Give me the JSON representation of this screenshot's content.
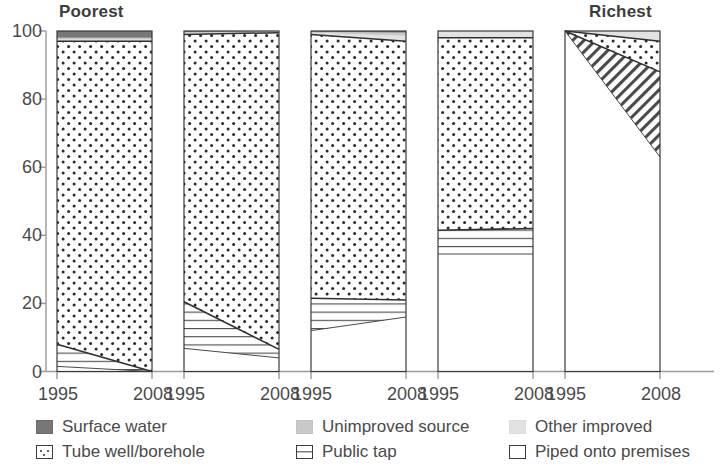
{
  "chart_data": {
    "type": "area",
    "title": "",
    "xlabel": "",
    "ylabel": "",
    "ylim": [
      0,
      100
    ],
    "yticks": [
      0,
      20,
      40,
      60,
      80,
      100
    ],
    "ytick_labels": [
      "0",
      "20",
      "40",
      "60",
      "80",
      "100"
    ],
    "grid": false,
    "x": [
      "1995",
      "2008"
    ],
    "x_tick_labels": [
      "1995",
      "2008",
      "1995",
      "2008",
      "1995",
      "2008",
      "1995",
      "2008",
      "1995",
      "2008"
    ],
    "group_labels": [
      "Poorest",
      "",
      "",
      "",
      "Richest"
    ],
    "legend_position": "bottom",
    "stack_order_bottom_to_top": [
      "Piped onto premises",
      "Public tap",
      "Tube well/borehole",
      "Other improved",
      "Unimproved source",
      "Surface water"
    ],
    "series": [
      {
        "name": "Piped onto premises",
        "pattern": "solid-white",
        "color": "#ffffff",
        "values_by_quintile": [
          {
            "quintile": "Poorest",
            "1995": 1.5,
            "2008": 0.0
          },
          {
            "quintile": "Second",
            "1995": 6.8,
            "2008": 4.0
          },
          {
            "quintile": "Middle",
            "1995": 12.0,
            "2008": 16.0
          },
          {
            "quintile": "Fourth",
            "1995": 34.5,
            "2008": 34.5
          },
          {
            "quintile": "Richest",
            "1995": 100.0,
            "2008": 63.0
          }
        ]
      },
      {
        "name": "Public tap",
        "pattern": "horizontal-lines",
        "color": "#ffffff",
        "values_by_quintile": [
          {
            "quintile": "Poorest",
            "1995": 6.5,
            "2008": 0.0
          },
          {
            "quintile": "Second",
            "1995": 13.7,
            "2008": 2.5
          },
          {
            "quintile": "Middle",
            "1995": 9.5,
            "2008": 5.0
          },
          {
            "quintile": "Fourth",
            "1995": 7.0,
            "2008": 7.5
          },
          {
            "quintile": "Richest",
            "1995": 0.0,
            "2008": 25.0
          }
        ]
      },
      {
        "name": "Tube well/borehole",
        "pattern": "dotted",
        "color": "#ffffff",
        "values_by_quintile": [
          {
            "quintile": "Poorest",
            "1995": 89.0,
            "2008": 97.0
          },
          {
            "quintile": "Second",
            "1995": 78.5,
            "2008": 93.0
          },
          {
            "quintile": "Middle",
            "1995": 77.5,
            "2008": 76.0
          },
          {
            "quintile": "Fourth",
            "1995": 56.5,
            "2008": 56.0
          },
          {
            "quintile": "Richest",
            "1995": 0.0,
            "2008": 9.0
          }
        ]
      },
      {
        "name": "Other improved",
        "pattern": "light-gray",
        "color": "#e2e2e2",
        "values_by_quintile": [
          {
            "quintile": "Poorest",
            "1995": 0.5,
            "2008": 0.5
          },
          {
            "quintile": "Second",
            "1995": 0.3,
            "2008": 0.3
          },
          {
            "quintile": "Middle",
            "1995": 0.5,
            "2008": 1.5
          },
          {
            "quintile": "Fourth",
            "1995": 2.0,
            "2008": 2.0
          },
          {
            "quintile": "Richest",
            "1995": 0.0,
            "2008": 3.0
          }
        ]
      },
      {
        "name": "Unimproved source",
        "pattern": "mid-gray",
        "color": "#c9c9c9",
        "values_by_quintile": [
          {
            "quintile": "Poorest",
            "1995": 0.5,
            "2008": 0.5
          },
          {
            "quintile": "Second",
            "1995": 0.4,
            "2008": 0.2
          },
          {
            "quintile": "Middle",
            "1995": 0.3,
            "2008": 1.0
          },
          {
            "quintile": "Fourth",
            "1995": 0.0,
            "2008": 0.0
          },
          {
            "quintile": "Richest",
            "1995": 0.0,
            "2008": 0.0
          }
        ]
      },
      {
        "name": "Surface water",
        "pattern": "dark-gray",
        "color": "#777777",
        "values_by_quintile": [
          {
            "quintile": "Poorest",
            "1995": 2.0,
            "2008": 2.0
          },
          {
            "quintile": "Second",
            "1995": 0.3,
            "2008": 0.0
          },
          {
            "quintile": "Middle",
            "1995": 0.2,
            "2008": 0.5
          },
          {
            "quintile": "Fourth",
            "1995": 0.0,
            "2008": 0.0
          },
          {
            "quintile": "Richest",
            "1995": 0.0,
            "2008": 0.0
          }
        ]
      }
    ]
  },
  "axis": {
    "y_ticks": [
      {
        "label": "100",
        "value": 100
      },
      {
        "label": "80",
        "value": 80
      },
      {
        "label": "60",
        "value": 60
      },
      {
        "label": "40",
        "value": 40
      },
      {
        "label": "20",
        "value": 20
      },
      {
        "label": "0",
        "value": 0
      }
    ],
    "x_labels": [
      "1995",
      "2008",
      "1995",
      "2008",
      "1995",
      "2008",
      "1995",
      "2008",
      "1995",
      "2008"
    ]
  },
  "group_titles": {
    "left": "Poorest",
    "right": "Richest"
  },
  "legend": {
    "items": [
      {
        "label": "Surface water",
        "swatch": "dark-gray-swatch",
        "swatch_class": "sw-surface"
      },
      {
        "label": "Unimproved source",
        "swatch": "mid-gray-swatch",
        "swatch_class": "sw-unimproved"
      },
      {
        "label": "Other improved",
        "swatch": "light-gray-swatch",
        "swatch_class": "sw-other"
      },
      {
        "label": "Tube well/borehole",
        "swatch": "dotted-swatch",
        "swatch_class": "sw-tube"
      },
      {
        "label": "Public tap",
        "swatch": "horizontal-lines-swatch",
        "swatch_class": "sw-tap"
      },
      {
        "label": "Piped onto premises",
        "swatch": "white-swatch",
        "swatch_class": "sw-piped"
      }
    ]
  },
  "colors": {
    "surface_water": "#777777",
    "unimproved_source": "#c9c9c9",
    "other_improved": "#e2e2e2",
    "outline": "#2f2f2f",
    "text": "#4a4a4a",
    "axis": "#9a9a9a"
  }
}
